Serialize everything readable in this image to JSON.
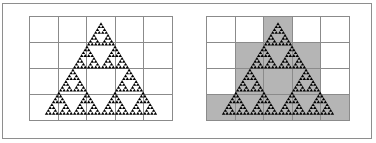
{
  "figure": {
    "title": "",
    "background_color": "#ffffff",
    "border_color": "#8e8e8e",
    "grid_line_color": "#8b8b8b",
    "shaded_cell_color": "#b5b5b5",
    "fractal_color": "#000000"
  },
  "panels": [
    {
      "id": "panel-left",
      "label": "",
      "grid": {
        "columns": 5,
        "rows": 4
      },
      "shading": "none",
      "shaded_cells": [
        [
          false,
          false,
          false,
          false,
          false
        ],
        [
          false,
          false,
          false,
          false,
          false
        ],
        [
          false,
          false,
          false,
          false,
          false
        ],
        [
          false,
          false,
          false,
          false,
          false
        ]
      ],
      "fractal": {
        "name": "sierpinski-triangle",
        "depth": 5,
        "apex": {
          "x": 50,
          "y": 6
        },
        "base_left": {
          "x": 11,
          "y": 94
        },
        "base_right": {
          "x": 89,
          "y": 94
        }
      }
    },
    {
      "id": "panel-right",
      "label": "",
      "grid": {
        "columns": 5,
        "rows": 4
      },
      "shading": "box-counting",
      "shaded_cell_count": 12,
      "shaded_cells": [
        [
          false,
          false,
          true,
          false,
          false
        ],
        [
          false,
          true,
          true,
          true,
          false
        ],
        [
          false,
          true,
          true,
          true,
          false
        ],
        [
          true,
          true,
          true,
          true,
          true
        ]
      ],
      "fractal": {
        "name": "sierpinski-triangle",
        "depth": 5,
        "apex": {
          "x": 50,
          "y": 6
        },
        "base_left": {
          "x": 11,
          "y": 94
        },
        "base_right": {
          "x": 89,
          "y": 94
        }
      }
    }
  ]
}
